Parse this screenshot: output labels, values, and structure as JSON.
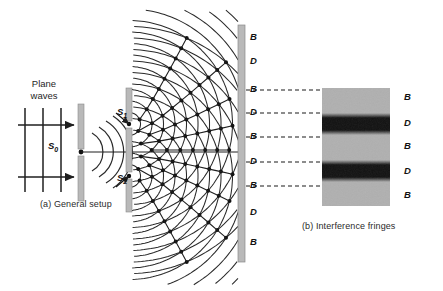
{
  "figure": {
    "width": 443,
    "height": 291,
    "background_color": "#ffffff"
  },
  "panel_a": {
    "caption": "(a) General setup",
    "caption_x": 40,
    "caption_y": 199,
    "plane_waves_label": "Plane\nwaves",
    "plane_waves_line1": "Plane",
    "plane_waves_line2": "waves",
    "plane_waves_x": 28,
    "plane_waves_y": 78,
    "source_slit_label": "S",
    "source_slit_sub": "0",
    "source_slit_label_x": 48,
    "source_slit_label_y": 141,
    "slit1_label": "S",
    "slit1_sub": "1",
    "slit1_label_x": 117,
    "slit1_label_y": 114,
    "slit2_label": "S",
    "slit2_sub": "2",
    "slit2_label_x": 117,
    "slit2_label_y": 178,
    "barrier_color": "#b9b9b9",
    "barrier_edge_color": "#8a8a8a",
    "wave_color": "#2a2a2a",
    "plane_wave_count": 3,
    "arrow_count": 2
  },
  "panel_b": {
    "caption": "(b) Interference fringes",
    "caption_x": 302,
    "caption_y": 221,
    "panel_left": 322,
    "panel_top": 88,
    "panel_width": 68,
    "panel_height": 118,
    "bright_color": "#b0b0b0",
    "dark_color": "#111111",
    "bands": [
      {
        "type": "B",
        "label": "B",
        "top": 0,
        "height": 25,
        "shade": "bright"
      },
      {
        "type": "D",
        "label": "D",
        "top": 25,
        "height": 22,
        "shade": "dark"
      },
      {
        "type": "B",
        "label": "B",
        "top": 47,
        "height": 25,
        "shade": "bright"
      },
      {
        "type": "D",
        "label": "D",
        "top": 72,
        "height": 22,
        "shade": "dark"
      },
      {
        "type": "B",
        "label": "B",
        "top": 94,
        "height": 24,
        "shade": "bright"
      }
    ]
  },
  "screen": {
    "x": 238,
    "y": 25,
    "width": 7,
    "height": 237,
    "color": "#b9b9b9",
    "edge_color": "#8a8a8a"
  },
  "screen_labels": {
    "x": 250,
    "items": [
      {
        "label": "B",
        "y": 38,
        "dashed": false
      },
      {
        "label": "D",
        "y": 62,
        "dashed": false
      },
      {
        "label": "B",
        "y": 90,
        "dashed": true
      },
      {
        "label": "D",
        "y": 113,
        "dashed": true
      },
      {
        "label": "B",
        "y": 137,
        "dashed": true
      },
      {
        "label": "D",
        "y": 162,
        "dashed": true
      },
      {
        "label": "B",
        "y": 186,
        "dashed": true
      },
      {
        "label": "D",
        "y": 213,
        "dashed": false
      },
      {
        "label": "B",
        "y": 243,
        "dashed": false
      }
    ]
  },
  "fringe_labels": {
    "x": 404,
    "items": [
      {
        "label": "B",
        "y": 98
      },
      {
        "label": "D",
        "y": 124
      },
      {
        "label": "B",
        "y": 147
      },
      {
        "label": "D",
        "y": 172
      },
      {
        "label": "B",
        "y": 196
      }
    ]
  },
  "connectors": {
    "color": "#1a1a1a",
    "dash": "4,3",
    "from_x": 246,
    "to_x": 322,
    "lines": [
      {
        "y": 90
      },
      {
        "y": 113
      },
      {
        "y": 137
      },
      {
        "y": 162
      },
      {
        "y": 186
      }
    ]
  },
  "legend_meaning": {
    "B": "Bright fringe",
    "D": "Dark fringe"
  }
}
